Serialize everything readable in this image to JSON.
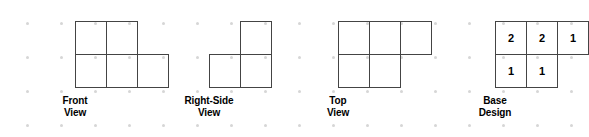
{
  "background": {
    "color": "#ffffff",
    "dot_color": "#d6d6d6",
    "dot_spacing_x": 34,
    "dot_spacing_y": 34
  },
  "style": {
    "line_color": "#444444",
    "text_color": "#000000",
    "cell_width": 32,
    "cell_height": 34
  },
  "chart_data": {
    "type": "diagram",
    "figures": [
      {
        "id": "front-view",
        "caption_lines": [
          "Front",
          "View"
        ],
        "rows": [
          {
            "cells": 2,
            "offset": 0
          },
          {
            "cells": 3,
            "offset": 0
          }
        ]
      },
      {
        "id": "right-side-view",
        "caption_lines": [
          "Right-Side",
          "View"
        ],
        "rows": [
          {
            "cells": 1,
            "offset": 1
          },
          {
            "cells": 2,
            "offset": 0
          }
        ]
      },
      {
        "id": "top-view",
        "caption_lines": [
          "Top",
          "View"
        ],
        "rows": [
          {
            "cells": 3,
            "offset": 0
          },
          {
            "cells": 2,
            "offset": 0
          }
        ]
      },
      {
        "id": "base-design",
        "caption_lines": [
          "Base",
          "Design"
        ],
        "rows": [
          {
            "cells": 3,
            "offset": 0,
            "values": [
              "2",
              "2",
              "1"
            ]
          },
          {
            "cells": 2,
            "offset": 0,
            "values": [
              "1",
              "1"
            ]
          }
        ]
      }
    ]
  },
  "figures": {
    "front": {
      "caption_line1": "Front",
      "caption_line2": "View"
    },
    "rightside": {
      "caption_line1": "Right-Side",
      "caption_line2": "View"
    },
    "top": {
      "caption_line1": "Top",
      "caption_line2": "View"
    },
    "base": {
      "caption_line1": "Base",
      "caption_line2": "Design",
      "cells": {
        "r0c0": "2",
        "r0c1": "2",
        "r0c2": "1",
        "r1c0": "1",
        "r1c1": "1"
      }
    }
  }
}
